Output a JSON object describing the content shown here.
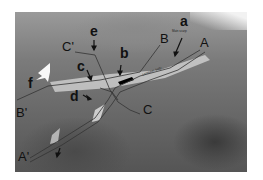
{
  "figure": {
    "labels": {
      "a": "a",
      "b": "b",
      "c": "c",
      "d": "d",
      "e": "e",
      "f": "f",
      "A": "A",
      "A_prime": "A'",
      "B": "B",
      "B_prime": "B'",
      "C": "C",
      "C_prime": "C'"
    },
    "annotations": {
      "main_scarp": "Main scarp",
      "road_text": "Landslide body"
    }
  }
}
